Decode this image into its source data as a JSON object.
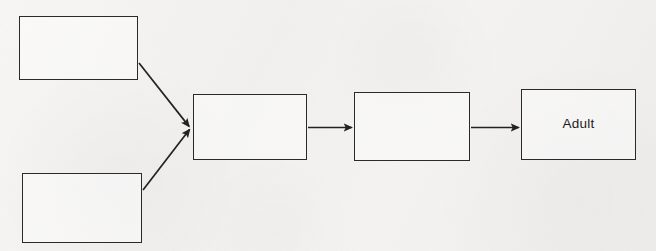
{
  "diagram": {
    "background_color": "#f3f2f0",
    "stroke_color": "#2a2a2a",
    "canvas": {
      "width": 656,
      "height": 251
    },
    "nodes": [
      {
        "id": "node-1",
        "name": "top-left-node",
        "label": "",
        "x": 19,
        "y": 16,
        "width": 119,
        "height": 64
      },
      {
        "id": "node-2",
        "name": "bottom-left-node",
        "label": "",
        "x": 22,
        "y": 173,
        "width": 120,
        "height": 70
      },
      {
        "id": "node-3",
        "name": "merge-node",
        "label": "",
        "x": 193,
        "y": 94,
        "width": 114,
        "height": 66
      },
      {
        "id": "node-4",
        "name": "middle-node",
        "label": "",
        "x": 354,
        "y": 92,
        "width": 116,
        "height": 69
      },
      {
        "id": "node-5",
        "name": "adult-node",
        "label": "Adult",
        "x": 521,
        "y": 89,
        "width": 115,
        "height": 71
      }
    ],
    "arrows": [
      {
        "id": "arrow-1",
        "name": "arrow-top-left-to-merge",
        "from": "node-1",
        "to": "node-3",
        "x1": 139,
        "y1": 63,
        "x2": 190,
        "y2": 127,
        "kind": "diagonal-down-right"
      },
      {
        "id": "arrow-2",
        "name": "arrow-bottom-left-to-merge",
        "from": "node-2",
        "to": "node-3",
        "x1": 143,
        "y1": 190,
        "x2": 190,
        "y2": 129,
        "kind": "diagonal-up-right"
      },
      {
        "id": "arrow-3",
        "name": "arrow-merge-to-middle",
        "from": "node-3",
        "to": "node-4",
        "x1": 308,
        "y1": 127,
        "x2": 352,
        "y2": 127,
        "kind": "horizontal"
      },
      {
        "id": "arrow-4",
        "name": "arrow-middle-to-adult",
        "from": "node-4",
        "to": "node-5",
        "x1": 471,
        "y1": 127,
        "x2": 519,
        "y2": 127,
        "kind": "horizontal"
      }
    ]
  }
}
